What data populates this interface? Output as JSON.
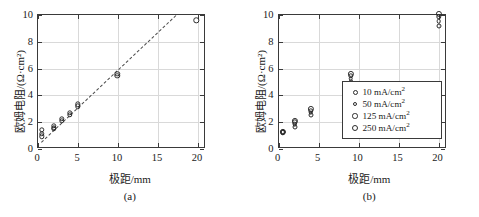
{
  "figure": {
    "background": "#ffffff",
    "axis_color": "#3a3a3a",
    "grid_color": "#d9d9d9",
    "marker_color": "#2b2b2b"
  },
  "panels": [
    {
      "caption": "(a)",
      "xlabel": "极距/mm",
      "ylabel": "欧姆电阻/(Ω·cm²)"
    },
    {
      "caption": "(b)",
      "xlabel": "极距/mm",
      "ylabel": "欧姆电阻/(Ω·cm²)"
    }
  ],
  "axis_ticks": {
    "x": [
      "0",
      "5",
      "10",
      "15",
      "20"
    ],
    "y": [
      "0",
      "2",
      "4",
      "6",
      "8",
      "10"
    ]
  },
  "legend": {
    "entries": [
      {
        "label": "10 mA/cm",
        "exp": "2",
        "size": 5.0
      },
      {
        "label": "50 mA/cm",
        "exp": "2",
        "size": 4.6
      },
      {
        "label": "125 mA/cm",
        "exp": "2",
        "size": 5.4
      },
      {
        "label": "250 mA/cm",
        "exp": "2",
        "size": 6.2
      }
    ]
  },
  "chart_data": [
    {
      "type": "scatter",
      "title": "(a)",
      "xlabel": "极距/mm",
      "ylabel": "欧姆电阻/(Ω·cm²)",
      "xlim": [
        0,
        21
      ],
      "ylim": [
        0,
        10
      ],
      "xticks": [
        0,
        5,
        10,
        15,
        20
      ],
      "yticks": [
        0,
        2,
        4,
        6,
        8,
        10
      ],
      "grid": true,
      "legend": "none",
      "marker": "open-circle",
      "points": [
        {
          "x": 0.5,
          "y": 1.45
        },
        {
          "x": 0.5,
          "y": 1.15
        },
        {
          "x": 0.5,
          "y": 0.95
        },
        {
          "x": 2.0,
          "y": 1.75
        },
        {
          "x": 2.0,
          "y": 1.6
        },
        {
          "x": 2.0,
          "y": 1.5
        },
        {
          "x": 3.0,
          "y": 2.25
        },
        {
          "x": 3.0,
          "y": 2.1
        },
        {
          "x": 4.0,
          "y": 2.7
        },
        {
          "x": 4.0,
          "y": 2.55
        },
        {
          "x": 5.0,
          "y": 3.35
        },
        {
          "x": 5.0,
          "y": 3.2
        },
        {
          "x": 9.9,
          "y": 5.6
        },
        {
          "x": 9.9,
          "y": 5.45
        },
        {
          "x": 19.8,
          "y": 9.6
        }
      ],
      "trendline": {
        "style": "dashed",
        "x_start": 0.4,
        "y_start": 0.55,
        "x_end": 17.2,
        "y_end": 10.0
      }
    },
    {
      "type": "scatter",
      "title": "(b)",
      "xlabel": "极距/mm",
      "ylabel": "欧姆电阻/(Ω·cm²)",
      "xlim": [
        0,
        21
      ],
      "ylim": [
        0,
        10
      ],
      "xticks": [
        0,
        5,
        10,
        15,
        20
      ],
      "yticks": [
        0,
        2,
        4,
        6,
        8,
        10
      ],
      "grid": true,
      "legend": "lower-right",
      "marker": "open-circle",
      "series": [
        {
          "name": "10 mA/cm2",
          "marker_size": 5.0,
          "x": [
            0.5,
            2.0,
            4.0,
            9.0,
            20.0
          ],
          "y": [
            1.25,
            1.65,
            2.55,
            5.0,
            9.2
          ]
        },
        {
          "name": "50 mA/cm2",
          "marker_size": 4.6,
          "x": [
            0.5,
            2.0,
            4.0,
            9.0,
            20.0
          ],
          "y": [
            1.25,
            1.85,
            2.7,
            5.25,
            9.55
          ]
        },
        {
          "name": "125 mA/cm2",
          "marker_size": 5.4,
          "x": [
            0.5,
            2.0,
            4.0,
            9.0,
            20.0
          ],
          "y": [
            1.25,
            2.0,
            2.85,
            5.45,
            9.85
          ]
        },
        {
          "name": "250 mA/cm2",
          "marker_size": 6.2,
          "x": [
            0.5,
            2.0,
            4.0,
            9.0,
            20.0
          ],
          "y": [
            1.25,
            2.1,
            3.0,
            5.6,
            10.1
          ]
        }
      ]
    }
  ]
}
